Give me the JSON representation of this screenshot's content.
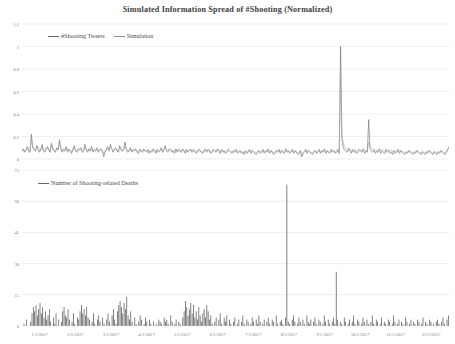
{
  "title": "Simulated Information Spread of #Shooting (Normalized)",
  "colors": {
    "series_tweets": "#6a6a6a",
    "series_simulation": "#a0a0a0",
    "deaths_bars": "#595959",
    "gridline": "#e3e3e3",
    "tick_text": "#7f7f7f",
    "title_text": "#3f3f3f"
  },
  "top_panel": {
    "legend": [
      {
        "label": "#Shooting Tweets",
        "swatch": "line-swatch-dark"
      },
      {
        "label": "Simulation",
        "swatch": "line-swatch-light"
      }
    ]
  },
  "bottom_panel": {
    "legend": [
      {
        "label": "Number of Shooting-related Deaths",
        "swatch": "line-swatch-dark"
      }
    ]
  },
  "chart_data": [
    {
      "type": "line",
      "id": "simulated-information-spread",
      "title": "Simulated Information Spread of #Shooting (Normalized)",
      "xlabel": "",
      "ylabel": "",
      "ylim": [
        0,
        1.2
      ],
      "yticks": [
        0,
        0.2,
        0.4,
        0.6,
        0.8,
        1,
        1.2
      ],
      "ytick_labels": [
        "0",
        "0.2",
        "0.4",
        "0.6",
        "0.8",
        "1",
        "1.2"
      ],
      "grid": true,
      "legend_position": "top-left",
      "x": [
        "1/1/2017",
        "2/1/2017",
        "3/1/2017",
        "4/1/2017",
        "5/1/2017",
        "6/1/2017",
        "7/1/2017",
        "8/1/2017",
        "9/1/2017",
        "10/1/2017",
        "11/1/2017",
        "12/1/2017"
      ],
      "xtick_labels": [
        "1/1/2017",
        "2/1/2017",
        "3/1/2017",
        "4/1/2017",
        "5/1/2017",
        "6/1/2017",
        "7/1/2017",
        "8/1/2017",
        "9/1/2017",
        "10/1/2017",
        "11/1/2017",
        "12/1/2017"
      ],
      "series": [
        {
          "name": "#Shooting Tweets",
          "color": "#6a6a6a",
          "values": [
            0.07,
            0.09,
            0.06,
            0.08,
            0.11,
            0.07,
            0.06,
            0.22,
            0.1,
            0.08,
            0.07,
            0.12,
            0.09,
            0.06,
            0.08,
            0.13,
            0.07,
            0.06,
            0.09,
            0.11,
            0.08,
            0.06,
            0.14,
            0.09,
            0.07,
            0.06,
            0.1,
            0.08,
            0.17,
            0.09,
            0.06,
            0.08,
            0.07,
            0.11,
            0.06,
            0.09,
            0.07,
            0.05,
            0.08,
            0.12,
            0.07,
            0.06,
            0.09,
            0.08,
            0.1,
            0.06,
            0.07,
            0.13,
            0.08,
            0.06,
            0.09,
            0.07,
            0.11,
            0.06,
            0.08,
            0.07,
            0.1,
            0.06,
            0.08,
            0.09,
            0.07,
            0.02,
            0.06,
            0.08,
            0.11,
            0.07,
            0.13,
            0.09,
            0.06,
            0.08,
            0.1,
            0.07,
            0.06,
            0.12,
            0.08,
            0.07,
            0.09,
            0.15,
            0.08,
            0.06,
            0.07,
            0.1,
            0.06,
            0.08,
            0.07,
            0.09,
            0.06,
            0.05,
            0.08,
            0.07,
            0.06,
            0.09,
            0.07,
            0.06,
            0.08,
            0.05,
            0.07,
            0.06,
            0.09,
            0.07,
            0.05,
            0.08,
            0.06,
            0.07,
            0.1,
            0.06,
            0.08,
            0.12,
            0.07,
            0.06,
            0.09,
            0.08,
            0.06,
            0.07,
            0.05,
            0.09,
            0.06,
            0.08,
            0.07,
            0.06,
            0.09,
            0.07,
            0.05,
            0.08,
            0.06,
            0.07,
            0.09,
            0.06,
            0.08,
            0.07,
            0.05,
            0.06,
            0.08,
            0.07,
            0.06,
            0.05,
            0.07,
            0.09,
            0.06,
            0.08,
            0.07,
            0.05,
            0.06,
            0.08,
            0.07,
            0.06,
            0.09,
            0.07,
            0.05,
            0.08,
            0.06,
            0.07,
            0.05,
            0.06,
            0.08,
            0.07,
            0.06,
            0.05,
            0.07,
            0.06,
            0.08,
            0.05,
            0.06,
            0.07,
            0.05,
            0.06,
            0.04,
            0.07,
            0.05,
            0.06,
            0.08,
            0.05,
            0.07,
            0.06,
            0.05,
            0.04,
            0.06,
            0.07,
            0.05,
            0.06,
            0.08,
            0.05,
            0.07,
            0.06,
            0.09,
            0.05,
            0.07,
            0.06,
            0.04,
            0.05,
            0.07,
            0.06,
            0.08,
            0.05,
            0.07,
            0.06,
            0.05,
            0.09,
            0.06,
            0.07,
            0.05,
            0.06,
            0.08,
            0.05,
            0.07,
            0.06,
            0.04,
            0.05,
            0.07,
            0.02,
            0.05,
            0.06,
            0.08,
            0.05,
            0.07,
            0.06,
            0.05,
            0.04,
            0.06,
            0.07,
            0.05,
            0.06,
            0.08,
            0.05,
            0.07,
            0.06,
            0.09,
            0.05,
            0.07,
            0.06,
            0.05,
            0.08,
            0.06,
            0.07,
            0.05,
            0.06,
            0.08,
            0.05,
            1.0,
            0.18,
            0.1,
            0.08,
            0.07,
            0.06,
            0.09,
            0.07,
            0.05,
            0.08,
            0.06,
            0.07,
            0.05,
            0.06,
            0.08,
            0.07,
            0.06,
            0.09,
            0.05,
            0.07,
            0.06,
            0.35,
            0.09,
            0.07,
            0.06,
            0.08,
            0.05,
            0.07,
            0.06,
            0.09,
            0.05,
            0.07,
            0.06,
            0.05,
            0.08,
            0.06,
            0.07,
            0.05,
            0.06,
            0.04,
            0.07,
            0.05,
            0.06,
            0.08,
            0.05,
            0.07,
            0.06,
            0.05,
            0.04,
            0.06,
            0.05,
            0.07,
            0.06,
            0.05,
            0.04,
            0.06,
            0.05,
            0.07,
            0.06,
            0.05,
            0.04,
            0.06,
            0.05,
            0.04,
            0.06,
            0.05,
            0.07,
            0.06,
            0.05,
            0.04,
            0.06,
            0.05,
            0.04,
            0.06,
            0.05,
            0.07,
            0.06,
            0.05,
            0.04,
            0.06,
            0.08,
            0.11
          ]
        },
        {
          "name": "Simulation",
          "color": "#a0a0a0",
          "values": [
            0.06,
            0.08,
            0.07,
            0.09,
            0.1,
            0.08,
            0.07,
            0.18,
            0.12,
            0.09,
            0.08,
            0.1,
            0.11,
            0.07,
            0.09,
            0.11,
            0.08,
            0.07,
            0.1,
            0.09,
            0.09,
            0.07,
            0.12,
            0.1,
            0.08,
            0.07,
            0.09,
            0.09,
            0.14,
            0.11,
            0.07,
            0.09,
            0.08,
            0.1,
            0.07,
            0.08,
            0.08,
            0.06,
            0.09,
            0.1,
            0.08,
            0.07,
            0.08,
            0.09,
            0.09,
            0.07,
            0.08,
            0.11,
            0.09,
            0.07,
            0.08,
            0.08,
            0.1,
            0.07,
            0.09,
            0.08,
            0.09,
            0.07,
            0.09,
            0.08,
            0.08,
            0.05,
            0.07,
            0.09,
            0.1,
            0.08,
            0.11,
            0.1,
            0.07,
            0.09,
            0.09,
            0.08,
            0.07,
            0.1,
            0.09,
            0.08,
            0.08,
            0.12,
            0.09,
            0.07,
            0.08,
            0.09,
            0.07,
            0.09,
            0.08,
            0.08,
            0.07,
            0.06,
            0.09,
            0.08,
            0.07,
            0.08,
            0.08,
            0.07,
            0.09,
            0.06,
            0.08,
            0.07,
            0.08,
            0.08,
            0.06,
            0.09,
            0.07,
            0.08,
            0.09,
            0.07,
            0.09,
            0.1,
            0.08,
            0.07,
            0.08,
            0.09,
            0.07,
            0.08,
            0.06,
            0.08,
            0.07,
            0.09,
            0.08,
            0.07,
            0.08,
            0.08,
            0.06,
            0.09,
            0.07,
            0.08,
            0.08,
            0.07,
            0.09,
            0.08,
            0.06,
            0.07,
            0.09,
            0.08,
            0.07,
            0.06,
            0.08,
            0.08,
            0.07,
            0.09,
            0.08,
            0.06,
            0.07,
            0.09,
            0.08,
            0.07,
            0.08,
            0.08,
            0.06,
            0.09,
            0.07,
            0.08,
            0.06,
            0.07,
            0.09,
            0.08,
            0.07,
            0.06,
            0.08,
            0.07,
            0.09,
            0.06,
            0.07,
            0.08,
            0.06,
            0.07,
            0.05,
            0.08,
            0.06,
            0.07,
            0.09,
            0.06,
            0.08,
            0.07,
            0.06,
            0.05,
            0.07,
            0.08,
            0.06,
            0.07,
            0.09,
            0.06,
            0.08,
            0.07,
            0.08,
            0.06,
            0.08,
            0.07,
            0.05,
            0.06,
            0.08,
            0.07,
            0.09,
            0.06,
            0.08,
            0.07,
            0.06,
            0.08,
            0.07,
            0.08,
            0.06,
            0.07,
            0.09,
            0.06,
            0.08,
            0.07,
            0.05,
            0.06,
            0.08,
            0.04,
            0.06,
            0.07,
            0.09,
            0.06,
            0.08,
            0.07,
            0.06,
            0.05,
            0.07,
            0.08,
            0.06,
            0.07,
            0.09,
            0.06,
            0.08,
            0.07,
            0.08,
            0.06,
            0.08,
            0.07,
            0.06,
            0.09,
            0.07,
            0.08,
            0.06,
            0.07,
            0.09,
            0.06,
            0.78,
            0.22,
            0.14,
            0.11,
            0.09,
            0.08,
            0.1,
            0.09,
            0.07,
            0.09,
            0.08,
            0.08,
            0.07,
            0.08,
            0.09,
            0.08,
            0.07,
            0.09,
            0.07,
            0.08,
            0.07,
            0.15,
            0.12,
            0.1,
            0.09,
            0.09,
            0.07,
            0.08,
            0.08,
            0.09,
            0.07,
            0.08,
            0.08,
            0.07,
            0.09,
            0.08,
            0.08,
            0.07,
            0.08,
            0.06,
            0.08,
            0.07,
            0.07,
            0.09,
            0.06,
            0.08,
            0.07,
            0.06,
            0.05,
            0.07,
            0.06,
            0.08,
            0.07,
            0.06,
            0.05,
            0.07,
            0.06,
            0.08,
            0.07,
            0.06,
            0.05,
            0.07,
            0.06,
            0.05,
            0.07,
            0.06,
            0.08,
            0.07,
            0.06,
            0.05,
            0.07,
            0.06,
            0.05,
            0.07,
            0.06,
            0.08,
            0.07,
            0.06,
            0.05,
            0.07,
            0.09,
            0.1
          ]
        }
      ],
      "annotations": [
        {
          "text": "major spike",
          "x": "10/1/2017",
          "y": 1.0
        },
        {
          "text": "secondary spike",
          "x": "11/1/2017",
          "y": 0.35
        }
      ]
    },
    {
      "type": "bar",
      "id": "shooting-related-deaths",
      "title": "",
      "xlabel": "",
      "ylabel": "",
      "ylim": [
        0,
        75
      ],
      "yticks": [
        0,
        15,
        30,
        45,
        60,
        75
      ],
      "ytick_labels": [
        "0",
        "15",
        "30",
        "45",
        "60",
        "75"
      ],
      "grid": true,
      "legend_position": "top-left",
      "categories": [
        "1/1/2017",
        "2/1/2017",
        "3/1/2017",
        "4/1/2017",
        "5/1/2017",
        "6/1/2017",
        "7/1/2017",
        "8/1/2017",
        "9/1/2017",
        "10/1/2017",
        "11/1/2017",
        "12/1/2017"
      ],
      "xtick_labels": [
        "1/1/2017",
        "2/1/2017",
        "3/1/2017",
        "4/1/2017",
        "5/1/2017",
        "6/1/2017",
        "7/1/2017",
        "8/1/2017",
        "9/1/2017",
        "10/1/2017",
        "11/1/2017",
        "12/1/2017"
      ],
      "series": [
        {
          "name": "Number of Shooting-related Deaths",
          "color": "#595959",
          "values": [
            0,
            1,
            0,
            3,
            0,
            0,
            2,
            6,
            9,
            7,
            10,
            5,
            8,
            11,
            6,
            9,
            4,
            7,
            3,
            5,
            8,
            2,
            0,
            4,
            1,
            6,
            0,
            3,
            0,
            2,
            7,
            9,
            5,
            4,
            8,
            3,
            0,
            2,
            6,
            1,
            0,
            4,
            3,
            7,
            10,
            6,
            8,
            5,
            9,
            4,
            3,
            0,
            2,
            6,
            1,
            0,
            3,
            5,
            2,
            0,
            4,
            1,
            0,
            3,
            6,
            2,
            0,
            5,
            8,
            3,
            1,
            7,
            10,
            12,
            9,
            6,
            11,
            8,
            14,
            5,
            3,
            7,
            2,
            0,
            4,
            1,
            0,
            2,
            5,
            3,
            0,
            1,
            4,
            2,
            0,
            3,
            1,
            0,
            2,
            0,
            1,
            0,
            3,
            2,
            1,
            0,
            4,
            2,
            3,
            1,
            0,
            5,
            2,
            0,
            1,
            3,
            0,
            2,
            1,
            0,
            4,
            7,
            12,
            9,
            5,
            8,
            11,
            6,
            10,
            4,
            7,
            3,
            9,
            5,
            2,
            6,
            8,
            4,
            10,
            7,
            3,
            5,
            1,
            0,
            2,
            4,
            0,
            3,
            6,
            1,
            0,
            4,
            2,
            5,
            0,
            3,
            1,
            0,
            2,
            4,
            0,
            1,
            3,
            0,
            2,
            5,
            1,
            0,
            3,
            2,
            0,
            1,
            4,
            2,
            0,
            3,
            1,
            5,
            2,
            0,
            1,
            3,
            0,
            2,
            4,
            1,
            0,
            3,
            2,
            0,
            5,
            1,
            0,
            2,
            3,
            1,
            0,
            4,
            68,
            2,
            1,
            0,
            3,
            5,
            2,
            0,
            1,
            4,
            2,
            0,
            3,
            1,
            0,
            5,
            2,
            1,
            3,
            0,
            2,
            4,
            1,
            0,
            3,
            2,
            0,
            1,
            5,
            2,
            0,
            3,
            1,
            0,
            2,
            4,
            1,
            26,
            3,
            0,
            2,
            1,
            0,
            4,
            2,
            0,
            1,
            3,
            0,
            2,
            5,
            1,
            0,
            3,
            2,
            0,
            1,
            4,
            2,
            0,
            3,
            1,
            0,
            2,
            5,
            1,
            0,
            3,
            2,
            0,
            1,
            4,
            0,
            2,
            1,
            0,
            3,
            2,
            0,
            1,
            5,
            2,
            0,
            1,
            3,
            0,
            2,
            1,
            0,
            4,
            2,
            0,
            1,
            3,
            0,
            2,
            1,
            0,
            3,
            2,
            0,
            1,
            4,
            0,
            2,
            1,
            0,
            3,
            2,
            0,
            1,
            0,
            2,
            3,
            1,
            0,
            2,
            4,
            1,
            0,
            3,
            5
          ]
        }
      ],
      "annotations": [
        {
          "text": "largest death toll",
          "x": "10/1/2017",
          "y": 68
        },
        {
          "text": "secondary peak",
          "x": "11/1/2017",
          "y": 26
        }
      ]
    }
  ]
}
